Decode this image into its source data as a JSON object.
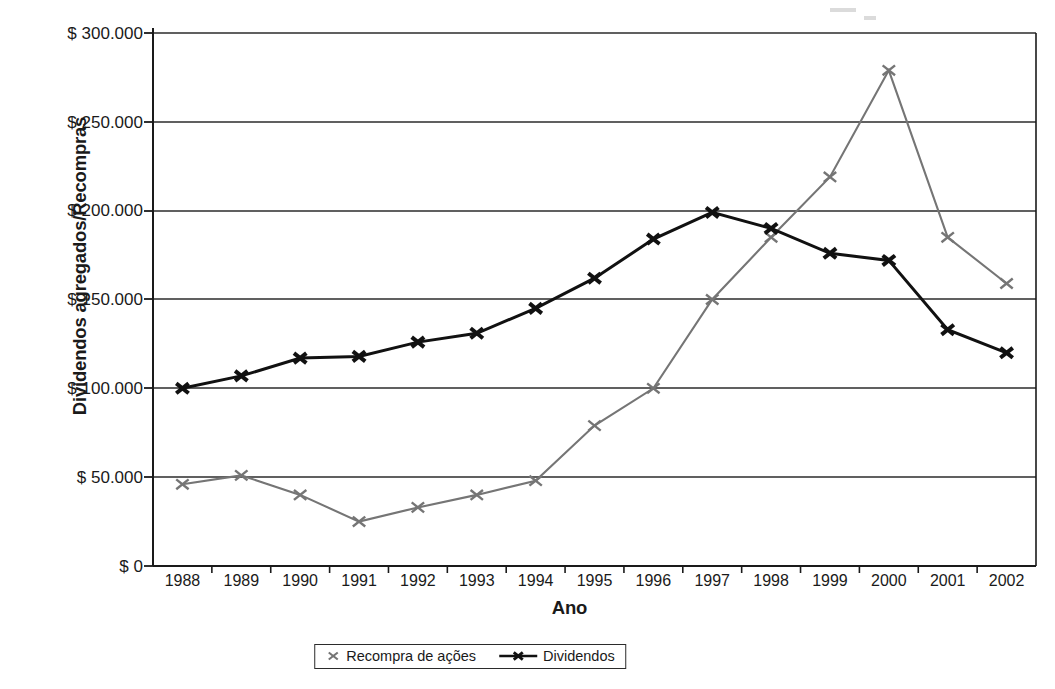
{
  "chart_data": {
    "type": "line",
    "title": "",
    "xlabel": "Ano",
    "ylabel": "Dividendos agregados/Recompras",
    "categories": [
      "1988",
      "1989",
      "1990",
      "1991",
      "1992",
      "1993",
      "1994",
      "1995",
      "1996",
      "1997",
      "1998",
      "1999",
      "2000",
      "2001",
      "2002"
    ],
    "ylim": [
      0,
      300000
    ],
    "ytick_values": [
      0,
      50000,
      100000,
      150000,
      200000,
      250000,
      300000
    ],
    "ytick_labels": [
      "$ 0",
      "$ 50.000",
      "$ 100.000",
      "$ 150.000",
      "$ 200.000",
      "$ 250.000",
      "$ 300.000"
    ],
    "grid": "horizontal",
    "legend_position": "bottom",
    "series": [
      {
        "name": "Recompra de ações",
        "color": "#757575",
        "marker": "x",
        "values": [
          46000,
          51000,
          40000,
          25000,
          33000,
          40000,
          48000,
          79000,
          100000,
          150000,
          185000,
          219000,
          279000,
          185000,
          159000
        ]
      },
      {
        "name": "Dividendos",
        "color": "#111111",
        "marker": "x",
        "values": [
          100000,
          107000,
          117000,
          118000,
          126000,
          131000,
          145000,
          162000,
          184000,
          199000,
          190000,
          176000,
          172000,
          133000,
          120000
        ]
      }
    ]
  },
  "axes": {
    "y_title": "Dividendos agregados/Recompras",
    "x_title": "Ano"
  },
  "legend": {
    "items": [
      {
        "label": "Recompra de ações",
        "marker": "x-marker-gray"
      },
      {
        "label": "Dividendos",
        "marker": "x-marker-black-line"
      }
    ]
  },
  "colors": {
    "series_repurchase": "#757575",
    "series_dividends": "#111111",
    "axis": "#1a1a1a",
    "grid": "#2b2b2b",
    "background": "#ffffff"
  }
}
